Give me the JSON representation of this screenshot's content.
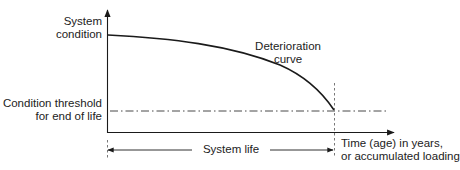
{
  "diagram": {
    "y_axis_label": [
      "System",
      "condition"
    ],
    "curve_label": [
      "Deterioration",
      "curve"
    ],
    "threshold_label": [
      "Condition threshold",
      "for end of life"
    ],
    "x_axis_label": [
      "Time (age) in years,",
      "or accumulated loading"
    ],
    "span_label": "System life",
    "colors": {
      "line": "#1a1a1a",
      "background": "#ffffff"
    }
  }
}
